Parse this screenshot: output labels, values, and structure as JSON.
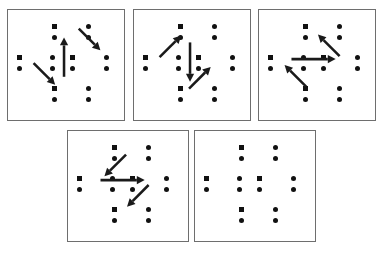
{
  "figure": {
    "kind": "static-diagram",
    "background_color": "#ffffff",
    "panel_border_color": "#6e6e6e",
    "marker_color": "#111111",
    "arrow_color": "#1a1a1a"
  },
  "geometry": {
    "marker_pair_slots": [
      {
        "id": "top-left",
        "x": 44,
        "y": 14
      },
      {
        "id": "top-right",
        "x": 78,
        "y": 14
      },
      {
        "id": "mid-far-left",
        "x": 9,
        "y": 45
      },
      {
        "id": "mid-left",
        "x": 42,
        "y": 45
      },
      {
        "id": "mid-right",
        "x": 62,
        "y": 45
      },
      {
        "id": "mid-far-right",
        "x": 96,
        "y": 45
      },
      {
        "id": "bot-left",
        "x": 44,
        "y": 76
      },
      {
        "id": "bot-right",
        "x": 78,
        "y": 76
      }
    ],
    "square_slots": [
      "top-left",
      "mid-far-left",
      "mid-right",
      "bot-left"
    ],
    "dot_diameter": 5,
    "square_size": 5,
    "pair_gap": 11
  },
  "panels": [
    {
      "index": 1,
      "name": "panel-1",
      "box": {
        "x": 7,
        "y": 9,
        "w": 118,
        "h": 112
      },
      "arrows": [
        {
          "name": "arrow-up-vertical",
          "direction": "up",
          "x1": 57,
          "y1": 68,
          "x2": 57,
          "y2": 28
        },
        {
          "name": "arrow-down-right-upper",
          "direction": "down-right",
          "x1": 72,
          "y1": 19,
          "x2": 94,
          "y2": 41
        },
        {
          "name": "arrow-down-right-lower",
          "direction": "down-right",
          "x1": 26,
          "y1": 54,
          "x2": 48,
          "y2": 76
        }
      ]
    },
    {
      "index": 2,
      "name": "panel-2",
      "box": {
        "x": 133,
        "y": 9,
        "w": 118,
        "h": 112
      },
      "arrows": [
        {
          "name": "arrow-down-vertical",
          "direction": "down",
          "x1": 57,
          "y1": 33,
          "x2": 57,
          "y2": 73
        },
        {
          "name": "arrow-up-right-upper",
          "direction": "up-right",
          "x1": 26,
          "y1": 48,
          "x2": 48,
          "y2": 26
        },
        {
          "name": "arrow-up-right-lower",
          "direction": "up-right",
          "x1": 56,
          "y1": 80,
          "x2": 78,
          "y2": 58
        }
      ]
    },
    {
      "index": 3,
      "name": "panel-3",
      "box": {
        "x": 258,
        "y": 9,
        "w": 118,
        "h": 112
      },
      "arrows": [
        {
          "name": "arrow-right-horizontal",
          "direction": "right",
          "x1": 33,
          "y1": 50,
          "x2": 78,
          "y2": 50
        },
        {
          "name": "arrow-up-left-upper",
          "direction": "up-left",
          "x1": 82,
          "y1": 47,
          "x2": 60,
          "y2": 25
        },
        {
          "name": "arrow-up-left-lower",
          "direction": "up-left",
          "x1": 48,
          "y1": 78,
          "x2": 26,
          "y2": 56
        }
      ]
    },
    {
      "index": 4,
      "name": "panel-4",
      "box": {
        "x": 67,
        "y": 130,
        "w": 122,
        "h": 112
      },
      "arrows": [
        {
          "name": "arrow-right-horizontal",
          "direction": "right",
          "x1": 33,
          "y1": 50,
          "x2": 78,
          "y2": 50
        },
        {
          "name": "arrow-down-left-upper",
          "direction": "down-left",
          "x1": 59,
          "y1": 24,
          "x2": 37,
          "y2": 46
        },
        {
          "name": "arrow-down-left-lower",
          "direction": "down-left",
          "x1": 82,
          "y1": 55,
          "x2": 60,
          "y2": 77
        }
      ]
    },
    {
      "index": 5,
      "name": "panel-5",
      "box": {
        "x": 194,
        "y": 130,
        "w": 122,
        "h": 112
      },
      "arrows": []
    }
  ]
}
